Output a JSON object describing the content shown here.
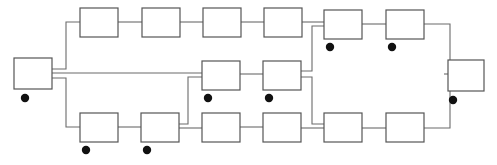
{
  "diagram": {
    "canvas": {
      "width": 497,
      "height": 165,
      "background": "#ffffff"
    },
    "style": {
      "node_fill": "#ffffff",
      "node_stroke": "#555555",
      "node_stroke_width": 1.2,
      "link_stroke": "#6b6b6b",
      "link_stroke_width": 1.1,
      "dot_fill": "#111111",
      "dot_radius": 4.2
    },
    "rows": [
      {
        "name": "top-row",
        "y": 8,
        "height": 29
      },
      {
        "name": "middle-row",
        "y": 61,
        "height": 29
      },
      {
        "name": "bottom-row",
        "y": 113,
        "height": 29
      }
    ],
    "nodes": [
      {
        "id": "n-input",
        "row": "middle-row",
        "label": "",
        "x": 14,
        "y": 58,
        "w": 38,
        "h": 31,
        "dot": true,
        "dot_cx": 25,
        "dot_cy": 98
      },
      {
        "id": "t1",
        "row": "top-row",
        "label": "",
        "x": 80,
        "y": 8,
        "w": 38,
        "h": 29,
        "dot": false
      },
      {
        "id": "t2",
        "row": "top-row",
        "label": "",
        "x": 142,
        "y": 8,
        "w": 38,
        "h": 29,
        "dot": false
      },
      {
        "id": "t3",
        "row": "top-row",
        "label": "",
        "x": 203,
        "y": 8,
        "w": 38,
        "h": 29,
        "dot": false
      },
      {
        "id": "t4",
        "row": "top-row",
        "label": "",
        "x": 264,
        "y": 8,
        "w": 38,
        "h": 29,
        "dot": false
      },
      {
        "id": "t5",
        "row": "top-row",
        "label": "",
        "x": 324,
        "y": 10,
        "w": 38,
        "h": 29,
        "dot": true,
        "dot_cx": 330,
        "dot_cy": 47
      },
      {
        "id": "t6",
        "row": "top-row",
        "label": "",
        "x": 386,
        "y": 10,
        "w": 38,
        "h": 29,
        "dot": true,
        "dot_cx": 392,
        "dot_cy": 47
      },
      {
        "id": "m1",
        "row": "middle-row",
        "label": "",
        "x": 202,
        "y": 61,
        "w": 38,
        "h": 29,
        "dot": true,
        "dot_cx": 208,
        "dot_cy": 98
      },
      {
        "id": "m2",
        "row": "middle-row",
        "label": "",
        "x": 263,
        "y": 61,
        "w": 38,
        "h": 29,
        "dot": true,
        "dot_cx": 269,
        "dot_cy": 98
      },
      {
        "id": "b1",
        "row": "bottom-row",
        "label": "",
        "x": 80,
        "y": 113,
        "w": 38,
        "h": 29,
        "dot": true,
        "dot_cx": 86,
        "dot_cy": 150
      },
      {
        "id": "b2",
        "row": "bottom-row",
        "label": "",
        "x": 141,
        "y": 113,
        "w": 38,
        "h": 29,
        "dot": true,
        "dot_cx": 147,
        "dot_cy": 150
      },
      {
        "id": "b3",
        "row": "bottom-row",
        "label": "",
        "x": 202,
        "y": 113,
        "w": 38,
        "h": 29,
        "dot": false
      },
      {
        "id": "b4",
        "row": "bottom-row",
        "label": "",
        "x": 263,
        "y": 113,
        "w": 38,
        "h": 29,
        "dot": false
      },
      {
        "id": "b5",
        "row": "bottom-row",
        "label": "",
        "x": 324,
        "y": 113,
        "w": 38,
        "h": 29,
        "dot": false
      },
      {
        "id": "b6",
        "row": "bottom-row",
        "label": "",
        "x": 386,
        "y": 113,
        "w": 38,
        "h": 29,
        "dot": false
      },
      {
        "id": "n-output",
        "row": "middle-row",
        "label": "",
        "x": 448,
        "y": 60,
        "w": 36,
        "h": 31,
        "dot": true,
        "dot_cx": 453,
        "dot_cy": 100
      }
    ],
    "links": [
      {
        "id": "l-in-up",
        "from": "n-input",
        "to": "t1",
        "path": "M52,69 L66,69 L66,22 L80,22"
      },
      {
        "id": "l-in-mid",
        "from": "n-input",
        "to": "m1",
        "path": "M52,73 L202,73"
      },
      {
        "id": "l-in-down",
        "from": "n-input",
        "to": "b1",
        "path": "M52,78 L66,78 L66,127 L80,127"
      },
      {
        "id": "l-t1-t2",
        "from": "t1",
        "to": "t2",
        "path": "M118,22 L142,22"
      },
      {
        "id": "l-t2-t3",
        "from": "t2",
        "to": "t3",
        "path": "M180,22 L203,22"
      },
      {
        "id": "l-t3-t4",
        "from": "t3",
        "to": "t4",
        "path": "M241,22 L264,22"
      },
      {
        "id": "l-t4-t5",
        "from": "t4",
        "to": "t5",
        "path": "M302,22 L324,22"
      },
      {
        "id": "l-t5-t6",
        "from": "t5",
        "to": "t6",
        "path": "M362,24 L386,24"
      },
      {
        "id": "l-t6-out",
        "from": "t6",
        "to": "n-output",
        "path": "M424,24 L450,24 L450,68 L448,68"
      },
      {
        "id": "l-b1-b2",
        "from": "b1",
        "to": "b2",
        "path": "M118,127 L141,127"
      },
      {
        "id": "l-b2-m1",
        "from": "b2",
        "to": "m1",
        "path": "M179,124 L188,124 L188,77 L202,77"
      },
      {
        "id": "l-b2-b3",
        "from": "b2",
        "to": "b3",
        "path": "M179,128 L202,128"
      },
      {
        "id": "l-m1-m2",
        "from": "m1",
        "to": "m2",
        "path": "M240,74 L263,74"
      },
      {
        "id": "l-b3-b4",
        "from": "b3",
        "to": "b4",
        "path": "M240,127 L263,127"
      },
      {
        "id": "l-m2-t5",
        "from": "m2",
        "to": "t5",
        "path": "M301,71 L312,71 L312,26 L324,26"
      },
      {
        "id": "l-m2-b5",
        "from": "m2",
        "to": "b5",
        "path": "M301,77 L312,77 L312,124 L324,124"
      },
      {
        "id": "l-b4-b5",
        "from": "b4",
        "to": "b5",
        "path": "M301,128 L324,128"
      },
      {
        "id": "l-b5-b6",
        "from": "b5",
        "to": "b6",
        "path": "M362,128 L386,128"
      },
      {
        "id": "l-b6-out",
        "from": "b6",
        "to": "n-output",
        "path": "M424,128 L450,128 L450,80 L448,80"
      },
      {
        "id": "l-out-stub",
        "from": "n-output",
        "to": "n-output",
        "path": "M444,74 L448,74"
      }
    ],
    "counts": {
      "nodes_total": 16,
      "links_total": 20,
      "dots_total": 8
    }
  }
}
